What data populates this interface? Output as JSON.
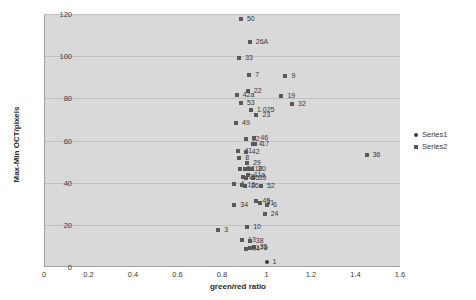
{
  "chart_data": {
    "type": "scatter",
    "title": "",
    "xlabel": "green/red ratio",
    "ylabel": "Max-Min OCT/pixels",
    "xlim": [
      0,
      1.6
    ],
    "ylim": [
      0,
      120
    ],
    "xticks": [
      "0",
      "0.2",
      "0.4",
      "0.6",
      "0.8",
      "1",
      "1.2",
      "1.4",
      "1.6"
    ],
    "yticks": [
      "0",
      "20",
      "40",
      "60",
      "80",
      "100",
      "120"
    ],
    "grid": "horizontal",
    "legend_position": "right",
    "series": [
      {
        "name": "Series1",
        "marker": "circle",
        "color": "#3c3c3c",
        "points": [
          {
            "label": "1",
            "x": 1.0,
            "y": 2.5
          }
        ]
      },
      {
        "name": "Series2",
        "marker": "square",
        "color": "#595959",
        "points": [
          {
            "label": "50",
            "x": 0.885,
            "y": 117.5
          },
          {
            "label": "26A",
            "x": 0.925,
            "y": 106.5
          },
          {
            "label": "33",
            "x": 0.877,
            "y": 99.0
          },
          {
            "label": "7",
            "x": 0.922,
            "y": 91.0
          },
          {
            "label": "9",
            "x": 1.085,
            "y": 90.5
          },
          {
            "label": "22",
            "x": 0.916,
            "y": 83.5
          },
          {
            "label": "42a",
            "x": 0.866,
            "y": 81.5
          },
          {
            "label": "19",
            "x": 1.067,
            "y": 81.0
          },
          {
            "label": "53",
            "x": 0.885,
            "y": 78.0
          },
          {
            "label": "1.025",
            "x": 0.93,
            "y": 74.5
          },
          {
            "label": "32",
            "x": 1.115,
            "y": 77.5
          },
          {
            "label": "23",
            "x": 0.955,
            "y": 72.0
          },
          {
            "label": "49",
            "x": 0.863,
            "y": 68.5
          },
          {
            "label": "12",
            "x": 0.907,
            "y": 60.5
          },
          {
            "label": "46",
            "x": 0.945,
            "y": 61.0
          },
          {
            "label": "17",
            "x": 0.95,
            "y": 58.5
          },
          {
            "label": "4",
            "x": 0.938,
            "y": 58.5
          },
          {
            "label": "41",
            "x": 0.874,
            "y": 55.0
          },
          {
            "label": "42",
            "x": 0.907,
            "y": 54.5
          },
          {
            "label": "36",
            "x": 1.45,
            "y": 53.0
          },
          {
            "label": "8",
            "x": 0.878,
            "y": 51.5
          },
          {
            "label": "29",
            "x": 0.912,
            "y": 49.5
          },
          {
            "label": "2",
            "x": 0.883,
            "y": 46.5
          },
          {
            "label": "1",
            "x": 0.905,
            "y": 46.5
          },
          {
            "label": "18",
            "x": 0.92,
            "y": 46.5
          },
          {
            "label": "20",
            "x": 0.935,
            "y": 46.5
          },
          {
            "label": "11a",
            "x": 0.917,
            "y": 43.5
          },
          {
            "label": "21",
            "x": 0.893,
            "y": 42.5
          },
          {
            "label": "25",
            "x": 0.906,
            "y": 42.0
          },
          {
            "label": "39",
            "x": 0.938,
            "y": 42.0
          },
          {
            "label": "4",
            "x": 0.855,
            "y": 39.5
          },
          {
            "label": "16",
            "x": 0.888,
            "y": 39.0
          },
          {
            "label": "26",
            "x": 0.903,
            "y": 38.5
          },
          {
            "label": "52",
            "x": 0.975,
            "y": 38.5
          },
          {
            "label": "45",
            "x": 0.955,
            "y": 31.5
          },
          {
            "label": "31",
            "x": 0.972,
            "y": 30.5
          },
          {
            "label": "6",
            "x": 1.002,
            "y": 29.5
          },
          {
            "label": "34",
            "x": 0.855,
            "y": 29.5
          },
          {
            "label": "24",
            "x": 0.992,
            "y": 25.0
          },
          {
            "label": "10",
            "x": 0.913,
            "y": 19.0
          },
          {
            "label": "3",
            "x": 0.783,
            "y": 17.5
          },
          {
            "label": "13",
            "x": 0.89,
            "y": 13.0
          },
          {
            "label": "38",
            "x": 0.925,
            "y": 12.5
          },
          {
            "label": "17a",
            "x": 0.925,
            "y": 9.0
          },
          {
            "label": "35",
            "x": 0.943,
            "y": 9.5
          },
          {
            "label": "44",
            "x": 0.908,
            "y": 8.5
          }
        ]
      }
    ]
  }
}
